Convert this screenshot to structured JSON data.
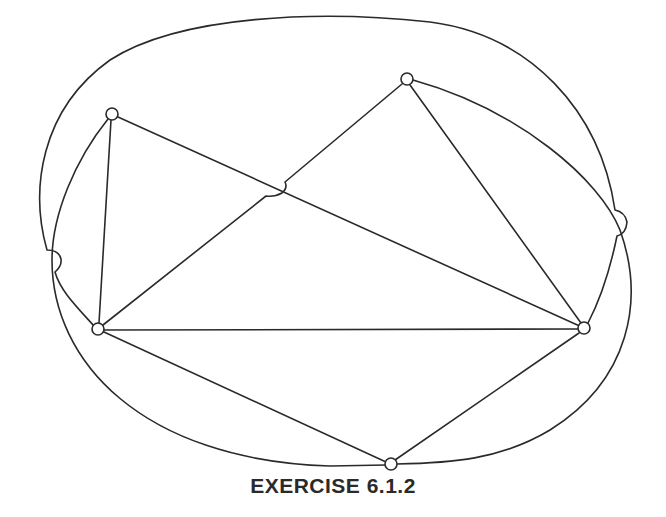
{
  "figure": {
    "caption": "EXERCISE 6.1.2",
    "stroke_color": "#2a2a2a",
    "background_color": "#ffffff"
  },
  "graph": {
    "nodes": [
      {
        "id": "A",
        "x": 112,
        "y": 114
      },
      {
        "id": "B",
        "x": 407,
        "y": 79
      },
      {
        "id": "C",
        "x": 98,
        "y": 329
      },
      {
        "id": "D",
        "x": 584,
        "y": 328
      },
      {
        "id": "E",
        "x": 391,
        "y": 464
      }
    ],
    "edges": [
      {
        "from": "A",
        "to": "C",
        "type": "straight"
      },
      {
        "from": "A",
        "to": "D",
        "type": "straight",
        "note": "crossed by C-B with a hop"
      },
      {
        "from": "C",
        "to": "B",
        "type": "straight",
        "note": "hops over A-D"
      },
      {
        "from": "C",
        "to": "D",
        "type": "straight"
      },
      {
        "from": "B",
        "to": "D",
        "type": "straight"
      },
      {
        "from": "C",
        "to": "E",
        "type": "straight"
      },
      {
        "from": "D",
        "to": "E",
        "type": "straight"
      },
      {
        "from": "A",
        "to": "E",
        "type": "curve",
        "note": "left then around bottom"
      },
      {
        "from": "C",
        "to": "D",
        "type": "curve",
        "note": "outer arc over top, hops on both sides"
      },
      {
        "from": "B",
        "to": "E",
        "type": "curve",
        "note": "right side then around bottom"
      }
    ],
    "crossing_hops": 3
  }
}
